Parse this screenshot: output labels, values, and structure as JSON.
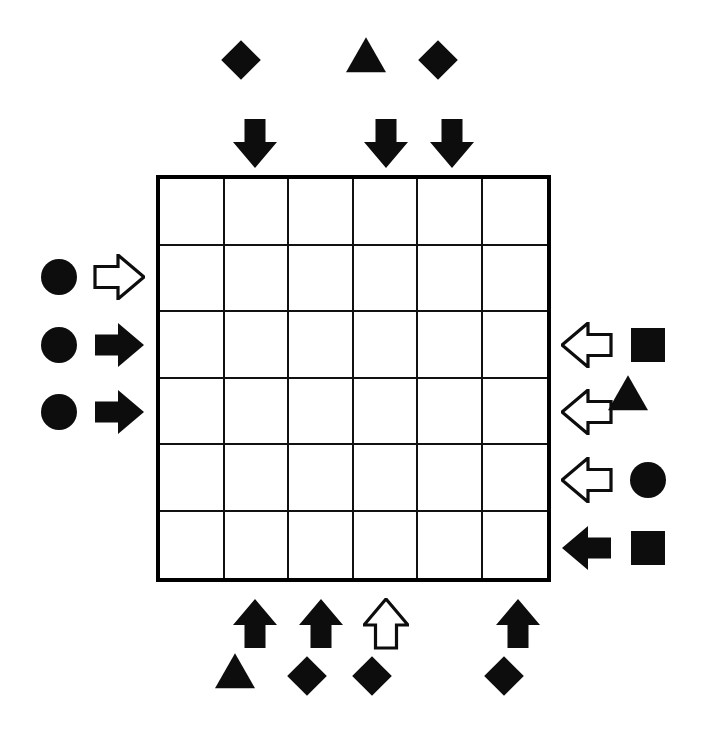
{
  "puzzle": {
    "title": "Grid Arrow Logic Puzzle",
    "grid": {
      "columns": 6,
      "rows": 6,
      "cells_empty": true,
      "border_color": "#000000",
      "cell_fill": "#ffffff"
    },
    "colors": {
      "ink": "#0d0d0d",
      "line": "#111111",
      "background": "#ffffff",
      "hollow_fill": "#ffffff"
    },
    "legend": {
      "filled_arrow": "solid black block arrow",
      "hollow_arrow": "white block arrow with black outline",
      "shapes": [
        "square",
        "circle",
        "triangle",
        "diamond"
      ]
    },
    "markers": {
      "top": [
        {
          "column": 2,
          "arrow": "down-arrow-filled",
          "arrow_style": "filled",
          "shape": "diamond",
          "shape_name": "diamond-shape"
        },
        {
          "column": 4,
          "arrow": "down-arrow-filled",
          "arrow_style": "filled",
          "shape": "triangle",
          "shape_name": "triangle-shape"
        },
        {
          "column": 5,
          "arrow": "down-arrow-filled",
          "arrow_style": "filled",
          "shape": "diamond",
          "shape_name": "diamond-shape"
        }
      ],
      "left": [
        {
          "row": 2,
          "arrow": "right-arrow-hollow",
          "arrow_style": "hollow",
          "shape": "circle",
          "shape_name": "circle-shape"
        },
        {
          "row": 3,
          "arrow": "right-arrow-filled",
          "arrow_style": "filled",
          "shape": "circle",
          "shape_name": "circle-shape"
        },
        {
          "row": 4,
          "arrow": "right-arrow-filled",
          "arrow_style": "filled",
          "shape": "circle",
          "shape_name": "circle-shape"
        }
      ],
      "right": [
        {
          "row": 3,
          "arrow": "left-arrow-hollow",
          "arrow_style": "hollow",
          "shape": "square",
          "shape_name": "square-shape"
        },
        {
          "row": 4,
          "arrow": "left-arrow-hollow",
          "arrow_style": "hollow",
          "shape": "triangle",
          "shape_name": "triangle-shape"
        },
        {
          "row": 5,
          "arrow": "left-arrow-hollow",
          "arrow_style": "hollow",
          "shape": "circle",
          "shape_name": "circle-shape"
        },
        {
          "row": 6,
          "arrow": "left-arrow-filled",
          "arrow_style": "filled",
          "shape": "square",
          "shape_name": "square-shape"
        }
      ],
      "bottom": [
        {
          "column": 2,
          "arrow": "up-arrow-filled",
          "arrow_style": "filled",
          "shape": "triangle",
          "shape_name": "triangle-shape"
        },
        {
          "column": 3,
          "arrow": "up-arrow-filled",
          "arrow_style": "filled",
          "shape": "diamond",
          "shape_name": "diamond-shape"
        },
        {
          "column": 4,
          "arrow": "up-arrow-hollow",
          "arrow_style": "hollow",
          "shape": "diamond",
          "shape_name": "diamond-shape"
        },
        {
          "column": 6,
          "arrow": "up-arrow-filled",
          "arrow_style": "filled",
          "shape": "diamond",
          "shape_name": "diamond-shape"
        }
      ]
    },
    "geometry": {
      "grid_left": 156,
      "grid_top": 175,
      "grid_width": 395,
      "grid_height": 407,
      "col_step": 65.83,
      "row_step": 67.83,
      "top_arrow_y": 143,
      "top_shape_y": 74,
      "bottom_arrow_y": 624,
      "bottom_shape_y": 690,
      "left_arrow_x": 119,
      "left_shape_x": 59,
      "right_arrow_x": 587,
      "right_shape_x": 648
    }
  }
}
